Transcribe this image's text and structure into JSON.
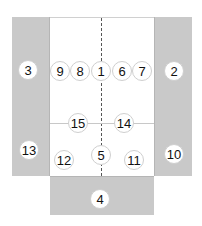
{
  "diagram": {
    "colors": {
      "side_panel": "#c9c9c9",
      "center": "#ffffff",
      "marker_bg": "#ffffff",
      "marker_text": "#111111",
      "dashed_line": "#555555"
    },
    "markers": [
      {
        "label": "3",
        "x": 28,
        "y": 70
      },
      {
        "label": "9",
        "x": 60,
        "y": 71
      },
      {
        "label": "8",
        "x": 80,
        "y": 71
      },
      {
        "label": "1",
        "x": 101,
        "y": 71
      },
      {
        "label": "6",
        "x": 122,
        "y": 71
      },
      {
        "label": "7",
        "x": 142,
        "y": 71
      },
      {
        "label": "2",
        "x": 174,
        "y": 71
      },
      {
        "label": "15",
        "x": 78,
        "y": 123
      },
      {
        "label": "14",
        "x": 124,
        "y": 123
      },
      {
        "label": "13",
        "x": 29,
        "y": 150
      },
      {
        "label": "12",
        "x": 64,
        "y": 160
      },
      {
        "label": "5",
        "x": 101,
        "y": 155
      },
      {
        "label": "11",
        "x": 134,
        "y": 160
      },
      {
        "label": "10",
        "x": 174,
        "y": 154
      },
      {
        "label": "4",
        "x": 100,
        "y": 199
      }
    ]
  }
}
